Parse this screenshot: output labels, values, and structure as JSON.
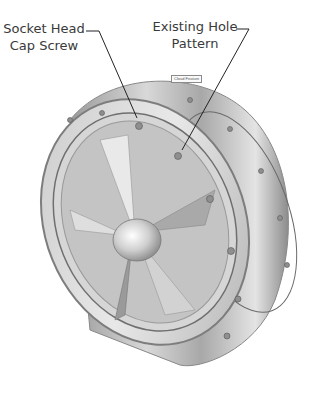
{
  "callouts": [
    {
      "id": "socket-head-cap-screw",
      "line1": "Socket Head",
      "line2": "Cap Screw"
    },
    {
      "id": "existing-hole-pattern",
      "line1": "Existing Hole",
      "line2": "Pattern"
    }
  ],
  "tag": {
    "label": "Cloud Feature"
  },
  "colors": {
    "text": "#3a3a3a",
    "leader": "#222222",
    "metal_light": "#e6e6e6",
    "metal_mid": "#b5b5b5",
    "metal_dark": "#7a7a7a"
  }
}
